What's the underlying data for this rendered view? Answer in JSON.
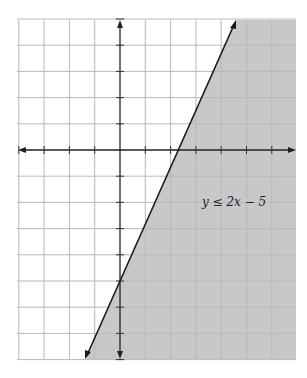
{
  "chart_data": {
    "type": "inequality-graph",
    "title": "",
    "xlabel": "",
    "ylabel": "",
    "xlim": [
      -4,
      7
    ],
    "ylim": [
      -8,
      5
    ],
    "grid": true,
    "grid_step": 1,
    "boundary_line": {
      "equation": "y = 2x - 5",
      "slope": 2,
      "intercept": -5,
      "style": "solid"
    },
    "shaded_region": "below-right of line (y <= 2x - 5)",
    "annotation": {
      "text": "y ≤ 2x − 5",
      "x": 4.5,
      "y": -2
    },
    "colors": {
      "shade": "#c8c8c8",
      "grid": "#b8b8b8",
      "grid_shaded": "#a2a2a2",
      "axis": "#222222",
      "line": "#1a1a1a"
    }
  },
  "labels": {
    "inequality": "y ≤ 2x − 5"
  }
}
